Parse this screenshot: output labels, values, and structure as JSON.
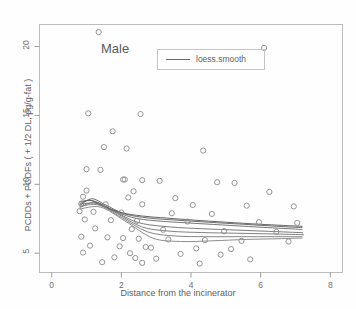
{
  "chart_data": {
    "type": "scatter",
    "title": "",
    "xlabel": "Distance from the incinerator",
    "ylabel": "PCDDs + PCDFs ( + 1/2 DL, pg/g-fat )",
    "annotation": "Male",
    "xlim": [
      -0.35,
      8.35
    ],
    "ylim": [
      3.6,
      21.6
    ],
    "xticks": [
      0,
      2,
      4,
      6,
      8
    ],
    "yticks": [
      5,
      10,
      15,
      20
    ],
    "xtick_labels": [
      "0",
      "2",
      "4",
      "6",
      "8"
    ],
    "ytick_labels": [
      "5",
      "10",
      "15",
      "20"
    ],
    "grid": false,
    "legend": {
      "position": "top-center-right",
      "entries": [
        {
          "label": "loess.smooth",
          "marker": "line",
          "color": "#5a5a5a"
        }
      ]
    },
    "marker": {
      "shape": "open-circle",
      "color": "#8a8a8a",
      "size": 3.4
    },
    "points": [
      [
        1.35,
        21.05
      ],
      [
        6.1,
        19.9
      ],
      [
        1.05,
        15.15
      ],
      [
        2.55,
        15.1
      ],
      [
        1.75,
        13.85
      ],
      [
        1.5,
        12.7
      ],
      [
        2.15,
        12.6
      ],
      [
        4.35,
        12.45
      ],
      [
        1.0,
        11.1
      ],
      [
        1.4,
        11.05
      ],
      [
        2.05,
        10.35
      ],
      [
        2.1,
        10.35
      ],
      [
        2.6,
        10.3
      ],
      [
        3.1,
        10.25
      ],
      [
        4.75,
        10.15
      ],
      [
        5.25,
        10.1
      ],
      [
        1.0,
        9.55
      ],
      [
        2.35,
        9.5
      ],
      [
        6.25,
        9.45
      ],
      [
        0.9,
        9.1
      ],
      [
        2.2,
        9.05
      ],
      [
        3.55,
        9.0
      ],
      [
        0.85,
        8.6
      ],
      [
        1.55,
        8.55
      ],
      [
        2.6,
        8.55
      ],
      [
        4.05,
        8.5
      ],
      [
        5.6,
        8.45
      ],
      [
        6.95,
        8.4
      ],
      [
        0.8,
        8.05
      ],
      [
        1.2,
        8.0
      ],
      [
        2.0,
        7.95
      ],
      [
        3.45,
        7.9
      ],
      [
        4.6,
        7.85
      ],
      [
        0.95,
        7.45
      ],
      [
        1.7,
        7.4
      ],
      [
        2.45,
        7.35
      ],
      [
        3.9,
        7.3
      ],
      [
        5.95,
        7.25
      ],
      [
        7.05,
        7.2
      ],
      [
        1.25,
        6.8
      ],
      [
        2.3,
        6.75
      ],
      [
        3.2,
        6.7
      ],
      [
        4.95,
        6.6
      ],
      [
        6.45,
        6.55
      ],
      [
        0.85,
        6.2
      ],
      [
        1.6,
        6.15
      ],
      [
        2.05,
        6.1
      ],
      [
        2.5,
        6.05
      ],
      [
        3.35,
        6.0
      ],
      [
        4.4,
        5.95
      ],
      [
        5.45,
        5.9
      ],
      [
        6.8,
        5.85
      ],
      [
        1.1,
        5.55
      ],
      [
        1.95,
        5.5
      ],
      [
        2.7,
        5.45
      ],
      [
        2.85,
        5.4
      ],
      [
        4.15,
        5.35
      ],
      [
        5.15,
        5.3
      ],
      [
        0.9,
        5.05
      ],
      [
        2.25,
        5.0
      ],
      [
        3.7,
        4.95
      ],
      [
        4.85,
        4.9
      ],
      [
        1.8,
        4.7
      ],
      [
        2.4,
        4.65
      ],
      [
        3.0,
        4.6
      ],
      [
        5.7,
        4.55
      ],
      [
        1.45,
        4.35
      ],
      [
        2.6,
        4.3
      ],
      [
        4.25,
        4.25
      ]
    ],
    "series": [
      {
        "name": "loess.smooth",
        "type": "line",
        "color": "#4a4a4a",
        "points": [
          [
            0.8,
            8.6
          ],
          [
            1.1,
            8.85
          ],
          [
            1.45,
            8.45
          ],
          [
            2.0,
            7.95
          ],
          [
            2.6,
            7.7
          ],
          [
            3.3,
            7.55
          ],
          [
            4.1,
            7.4
          ],
          [
            5.0,
            7.25
          ],
          [
            6.0,
            7.1
          ],
          [
            7.2,
            6.95
          ]
        ]
      },
      {
        "name": "loess.smooth-2",
        "type": "line",
        "color": "#545454",
        "points": [
          [
            0.8,
            8.45
          ],
          [
            1.15,
            8.95
          ],
          [
            1.55,
            8.5
          ],
          [
            2.1,
            7.85
          ],
          [
            2.8,
            7.55
          ],
          [
            3.6,
            7.4
          ],
          [
            4.5,
            7.25
          ],
          [
            5.5,
            7.1
          ],
          [
            6.5,
            6.95
          ],
          [
            7.2,
            6.85
          ]
        ]
      },
      {
        "name": "loess.smooth-3",
        "type": "line",
        "color": "#5e5e5e",
        "points": [
          [
            0.8,
            8.75
          ],
          [
            1.2,
            8.8
          ],
          [
            1.7,
            8.2
          ],
          [
            2.3,
            7.6
          ],
          [
            3.0,
            7.35
          ],
          [
            3.9,
            7.2
          ],
          [
            4.9,
            7.05
          ],
          [
            5.9,
            6.9
          ],
          [
            7.0,
            6.75
          ],
          [
            7.2,
            6.7
          ]
        ]
      },
      {
        "name": "loess.smooth-4",
        "type": "line",
        "color": "#646464",
        "points": [
          [
            0.8,
            8.3
          ],
          [
            1.25,
            8.7
          ],
          [
            1.8,
            8.05
          ],
          [
            2.45,
            7.25
          ],
          [
            3.2,
            6.95
          ],
          [
            4.1,
            6.8
          ],
          [
            5.1,
            6.7
          ],
          [
            6.1,
            6.6
          ],
          [
            7.1,
            6.5
          ],
          [
            7.2,
            6.48
          ]
        ]
      },
      {
        "name": "loess.smooth-5",
        "type": "line",
        "color": "#6a6a6a",
        "points": [
          [
            0.8,
            8.55
          ],
          [
            1.3,
            8.6
          ],
          [
            1.9,
            7.85
          ],
          [
            2.6,
            6.9
          ],
          [
            3.4,
            6.6
          ],
          [
            4.3,
            6.5
          ],
          [
            5.3,
            6.45
          ],
          [
            6.3,
            6.4
          ],
          [
            7.15,
            6.35
          ],
          [
            7.2,
            6.34
          ]
        ]
      },
      {
        "name": "loess.smooth-6",
        "type": "line",
        "color": "#707070",
        "points": [
          [
            0.8,
            8.4
          ],
          [
            1.35,
            8.5
          ],
          [
            2.0,
            7.6
          ],
          [
            2.75,
            6.55
          ],
          [
            3.55,
            6.25
          ],
          [
            4.45,
            6.2
          ],
          [
            5.45,
            6.2
          ],
          [
            6.4,
            6.2
          ],
          [
            7.2,
            6.2
          ]
        ]
      },
      {
        "name": "loess.smooth-7",
        "type": "line",
        "color": "#787878",
        "points": [
          [
            0.8,
            8.2
          ],
          [
            1.4,
            8.35
          ],
          [
            2.1,
            7.35
          ],
          [
            2.9,
            6.1
          ],
          [
            3.7,
            5.85
          ],
          [
            4.6,
            5.9
          ],
          [
            5.6,
            6.0
          ],
          [
            6.5,
            6.05
          ],
          [
            7.2,
            6.1
          ]
        ]
      }
    ]
  },
  "axes": {
    "frame_color": "#b9b9b9",
    "tick_color": "#9a9a9a"
  }
}
